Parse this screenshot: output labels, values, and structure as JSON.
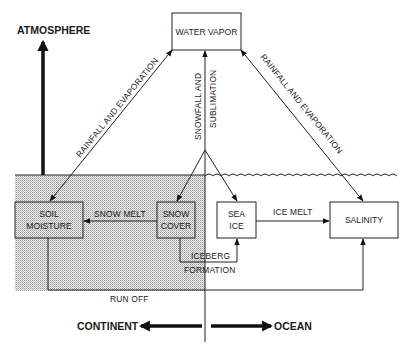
{
  "diagram": {
    "regions": {
      "atmosphere_label": "ATMOSPHERE",
      "continent_label": "CONTINENT",
      "ocean_label": "OCEAN"
    },
    "nodes": {
      "water_vapor": "WATER VAPOR",
      "soil_moisture_line1": "SOIL",
      "soil_moisture_line2": "MOISTURE",
      "snow_cover_line1": "SNOW",
      "snow_cover_line2": "COVER",
      "sea_ice_line1": "SEA",
      "sea_ice_line2": "ICE",
      "salinity": "SALINITY"
    },
    "edges": {
      "rainfall_evaporation_left": "RAINFALL AND EVAPORATION",
      "rainfall_evaporation_right": "RAINFALL AND EVAPORATION",
      "snowfall_line1": "SNOWFALL AND",
      "snowfall_line2": "SUBLIMATION",
      "snow_melt": "SNOW MELT",
      "ice_melt": "ICE MELT",
      "iceberg_line1": "ICEBERG",
      "iceberg_line2": "FORMATION",
      "run_off": "RUN OFF"
    },
    "colors": {
      "ink": "#222222",
      "background": "#ffffff",
      "land_shading": "#d9d9d9"
    }
  }
}
